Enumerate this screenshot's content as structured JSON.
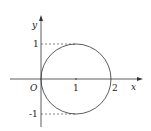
{
  "diagram": {
    "type": "coordinate-plot",
    "axes": {
      "x_label": "x",
      "y_label": "y",
      "origin_label": "O"
    },
    "ticks": {
      "x": [
        "1",
        "2"
      ],
      "y": [
        "1",
        "-1"
      ]
    },
    "circle": {
      "center": [
        1,
        0
      ],
      "radius": 1
    },
    "dashed_guides": [
      {
        "from": [
          0,
          1
        ],
        "to": [
          1,
          1
        ]
      },
      {
        "from": [
          0,
          -1
        ],
        "to": [
          1,
          -1
        ]
      }
    ]
  }
}
